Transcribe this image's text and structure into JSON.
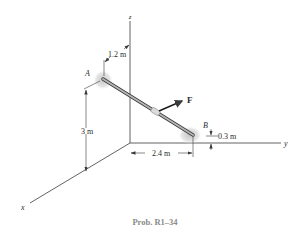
{
  "figure": {
    "caption": "Prob. R1–34",
    "axes": {
      "x_label": "x",
      "y_label": "y",
      "z_label": "z"
    },
    "points": {
      "a_label": "A",
      "b_label": "B"
    },
    "force": {
      "label": "F"
    },
    "dimensions": {
      "a_offset_from_z": "1.2 m",
      "a_height": "3 m",
      "b_along_y": "2.4 m",
      "b_height": "0.3 m"
    },
    "colors": {
      "rod": "#9a9a9a",
      "support_shadow": "#c8c8c8",
      "caption": "#8a8a8a"
    }
  }
}
